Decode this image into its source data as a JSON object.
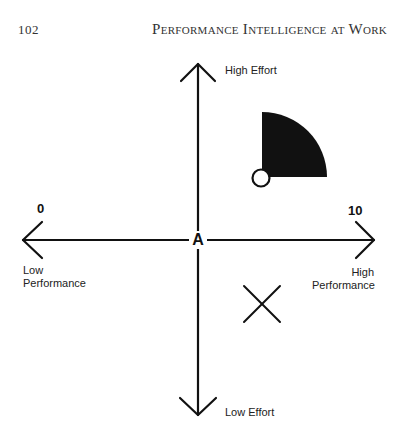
{
  "header": {
    "page_number": "102",
    "running_title": "Performance Intelligence at Work"
  },
  "diagram": {
    "origin_label": "A",
    "y_axis": {
      "top_label": "High Effort",
      "bottom_label": "Low Effort"
    },
    "x_axis": {
      "left_scale": "0",
      "right_scale": "10",
      "left_label_line1": "Low",
      "left_label_line2": "Performance",
      "right_label_line1": "High",
      "right_label_line2": "Performance"
    },
    "markers": [
      {
        "type": "quarter-circle-filled",
        "quadrant": "high-effort-high-performance",
        "color": "#111111"
      },
      {
        "type": "open-circle",
        "quadrant": "high-effort-high-performance"
      },
      {
        "type": "x-mark",
        "quadrant": "low-effort-high-performance"
      }
    ],
    "colors": {
      "ink": "#111111",
      "background": "#ffffff"
    }
  }
}
